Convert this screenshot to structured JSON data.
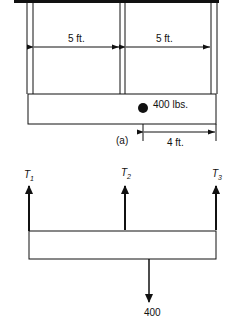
{
  "figure_a": {
    "label": "(a)",
    "left_span": "5 ft.",
    "right_span": "5 ft.",
    "weight": "400 lbs.",
    "weight_offset": "4 ft."
  },
  "figure_b": {
    "tension_1": "T",
    "tension_1_sub": "1",
    "tension_2": "T",
    "tension_2_sub": "2",
    "tension_3": "T",
    "tension_3_sub": "3",
    "load": "400"
  },
  "colors": {
    "ink": "#111111",
    "background": "#ffffff"
  }
}
